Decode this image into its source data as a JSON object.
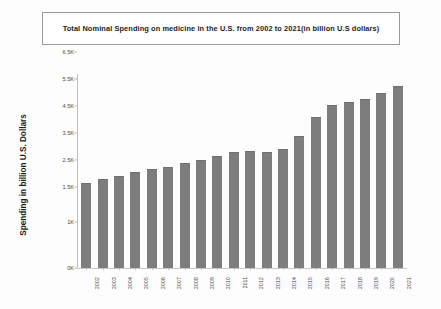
{
  "chart_data": {
    "type": "bar",
    "title": "Total Nominal Spending on medicine in the U.S. from 2002 to 2021(in billion U.S dollars)",
    "xlabel": "",
    "ylabel": "Spending in billion U.S. Dollars",
    "categories": [
      "2002",
      "2003",
      "2004",
      "2005",
      "2006",
      "2007",
      "2008",
      "2009",
      "2010",
      "2011",
      "2012",
      "2013",
      "2014",
      "2015",
      "2016",
      "2017",
      "2018",
      "2019",
      "2020",
      "2021"
    ],
    "values": [
      1650,
      1800,
      1900,
      2050,
      2150,
      2250,
      2400,
      2500,
      2650,
      2800,
      2850,
      2800,
      2900,
      3400,
      4100,
      4550,
      4650,
      4750,
      5000,
      5250
    ],
    "series": [
      {
        "name": "Total Nominal Spending",
        "values": [
          1650,
          1800,
          1900,
          2050,
          2150,
          2250,
          2400,
          2500,
          2650,
          2800,
          2850,
          2800,
          2900,
          3400,
          4100,
          4550,
          4650,
          4750,
          5000,
          5250
        ]
      }
    ],
    "ytick_labels": [
      "0K",
      "1K",
      "1.5K",
      "2.5K",
      "3.5K",
      "4.5K",
      "5.5K",
      "6.5K"
    ],
    "ytick_values": [
      0,
      1000,
      1500,
      2500,
      3500,
      4500,
      5500,
      6500
    ],
    "ylim": [
      0,
      6900
    ],
    "grid": false,
    "legend": false,
    "bar_color": "#7d7d7d",
    "background_color": "#ffffff"
  }
}
